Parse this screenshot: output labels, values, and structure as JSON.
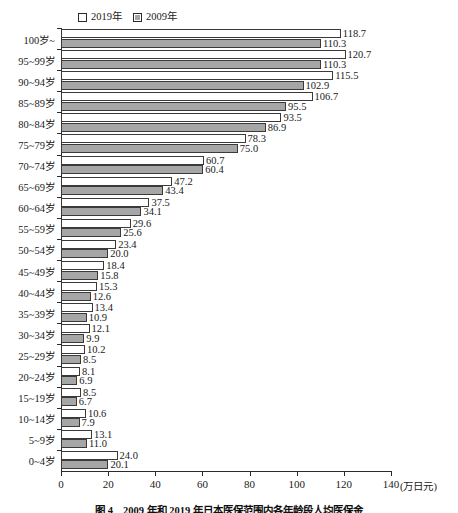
{
  "chart_data": {
    "type": "bar",
    "orientation": "horizontal",
    "title": "",
    "caption": "图 4　2009 年和 2019 年日本医保范围内各年龄段人均医保金",
    "xlabel": "",
    "xunit": "(万日元)",
    "ylabel": "",
    "xlim": [
      0,
      140
    ],
    "xticks": [
      0,
      20,
      40,
      60,
      80,
      100,
      120,
      140
    ],
    "grid": false,
    "legend_position": "top-left",
    "categories": [
      "100岁~",
      "95~99岁",
      "90~94岁",
      "85~89岁",
      "80~84岁",
      "75~79岁",
      "70~74岁",
      "65~69岁",
      "60~64岁",
      "55~59岁",
      "50~54岁",
      "45~49岁",
      "40~44岁",
      "35~39岁",
      "30~34岁",
      "25~29岁",
      "20~24岁",
      "15~19岁",
      "10~14岁",
      "5~9岁",
      "0~4岁"
    ],
    "series": [
      {
        "name": "2019年",
        "color": "#ffffff",
        "values": [
          118.7,
          120.7,
          115.5,
          106.7,
          93.5,
          78.3,
          60.7,
          47.2,
          37.5,
          29.6,
          23.4,
          18.4,
          15.3,
          13.4,
          12.1,
          10.2,
          8.1,
          8.5,
          10.6,
          13.1,
          24.0
        ]
      },
      {
        "name": "2009年",
        "color": "#a6a6a6",
        "values": [
          110.3,
          110.3,
          102.9,
          95.5,
          86.9,
          75.0,
          60.4,
          43.4,
          34.1,
          25.6,
          20.0,
          15.8,
          12.6,
          10.9,
          9.9,
          8.5,
          6.9,
          6.7,
          7.9,
          11.0,
          20.1
        ]
      }
    ]
  },
  "legend": {
    "entries": [
      {
        "label": "2019年",
        "swatch": "open-square-icon"
      },
      {
        "label": "2009年",
        "swatch": "filled-square-icon"
      }
    ]
  }
}
